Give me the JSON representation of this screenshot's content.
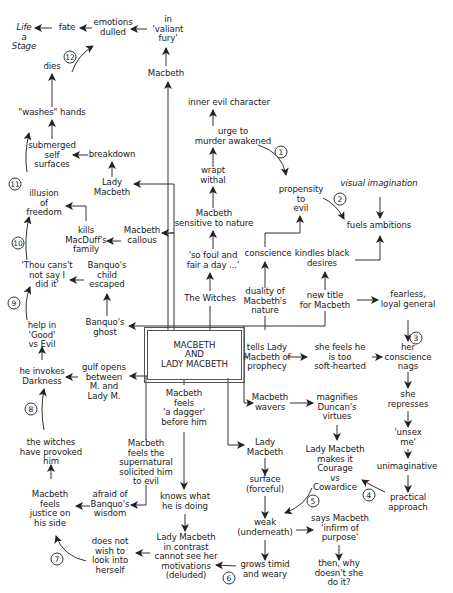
{
  "diagram": {
    "title": "MACBETH\nAND\nLADY MACBETH",
    "nodes": [
      {
        "id": "life-stage",
        "text": "Life\na\nStage",
        "italic": true,
        "x": 24,
        "y": 37
      },
      {
        "id": "fate",
        "text": "fate",
        "x": 67,
        "y": 28
      },
      {
        "id": "emotions-dulled",
        "text": "emotions\ndulled",
        "x": 113,
        "y": 28
      },
      {
        "id": "valiant-fury",
        "text": "in\n'valiant\nfury'",
        "x": 168,
        "y": 29
      },
      {
        "id": "dies",
        "text": "dies",
        "x": 52,
        "y": 67
      },
      {
        "id": "macbeth-top",
        "text": "Macbeth",
        "x": 166,
        "y": 74
      },
      {
        "id": "inner-evil",
        "text": "inner evil character",
        "x": 229,
        "y": 103
      },
      {
        "id": "washes-hands",
        "text": "\"washes\" hands",
        "x": 52,
        "y": 113
      },
      {
        "id": "urge-murder",
        "text": "urge to\nmurder awakened",
        "x": 233,
        "y": 137
      },
      {
        "id": "submerged-self",
        "text": "submerged\nself\nsurfaces",
        "x": 52,
        "y": 155
      },
      {
        "id": "breakdown",
        "text": "breakdown",
        "x": 112,
        "y": 155
      },
      {
        "id": "wrapt-withal",
        "text": "wrapt\nwithal",
        "x": 213,
        "y": 176
      },
      {
        "id": "lady-macbeth-left",
        "text": "Lady\nMacbeth",
        "x": 112,
        "y": 188
      },
      {
        "id": "propensity-evil",
        "text": "propensity\nto\nevil",
        "x": 301,
        "y": 199
      },
      {
        "id": "visual-imagination",
        "text": "visual imagination",
        "italic": true,
        "x": 379,
        "y": 184
      },
      {
        "id": "illusion-freedom",
        "text": "illusion\nof\nfreedom",
        "x": 44,
        "y": 203
      },
      {
        "id": "fuels-ambitions",
        "text": "fuels ambitions",
        "x": 379,
        "y": 226
      },
      {
        "id": "macbeth-sensitive",
        "text": "Macbeth\nsensitive to nature",
        "x": 214,
        "y": 219
      },
      {
        "id": "kills-macduff",
        "text": "kills\nMacDuff's\nfamily",
        "x": 86,
        "y": 240
      },
      {
        "id": "macbeth-callous",
        "text": "Macbeth\ncallous",
        "x": 142,
        "y": 236
      },
      {
        "id": "so-foul",
        "text": "'so foul and\nfair a day ...'",
        "x": 213,
        "y": 261
      },
      {
        "id": "conscience",
        "text": "conscience",
        "x": 268,
        "y": 254
      },
      {
        "id": "kindles-desires",
        "text": "kindles black\ndesires",
        "x": 322,
        "y": 259
      },
      {
        "id": "thou-canst",
        "text": "'Thou cans't\nnot say I\ndid it'",
        "x": 47,
        "y": 275
      },
      {
        "id": "banquo-child",
        "text": "Banquo's\nchild\nescaped",
        "x": 107,
        "y": 275
      },
      {
        "id": "the-witches",
        "text": "The Witches",
        "x": 210,
        "y": 299
      },
      {
        "id": "duality-nature",
        "text": "duality of\nMacbeth's\nnature",
        "x": 265,
        "y": 301
      },
      {
        "id": "new-title",
        "text": "new title\nfor Macbeth",
        "x": 325,
        "y": 301
      },
      {
        "id": "fearless-general",
        "text": "fearless,\nloyal general",
        "x": 408,
        "y": 300
      },
      {
        "id": "help-good-evil",
        "text": "help in\n'Good'\nvs Evil",
        "x": 42,
        "y": 335
      },
      {
        "id": "banquo-ghost",
        "text": "Banquo's\nghost",
        "x": 105,
        "y": 328
      },
      {
        "id": "tells-lady",
        "text": "tells Lady\nMacbeth of\nprophecy",
        "x": 267,
        "y": 357
      },
      {
        "id": "she-feels",
        "text": "she feels he\nis too\nsoft-hearted",
        "x": 340,
        "y": 357
      },
      {
        "id": "her-conscience",
        "text": "her\nconscience\nnags",
        "x": 408,
        "y": 357,
        "italicFirst": true
      },
      {
        "id": "he-invokes",
        "text": "he invokes\nDarkness",
        "x": 42,
        "y": 377
      },
      {
        "id": "gulf-opens",
        "text": "gulf opens\nbetween\nM. and\nLady M.",
        "x": 104,
        "y": 382
      },
      {
        "id": "macbeth-dagger",
        "text": "Macbeth\nfeels\n'a dagger'\nbefore him",
        "x": 184,
        "y": 408
      },
      {
        "id": "macbeth-wavers",
        "text": "Macbeth\nwavers",
        "x": 270,
        "y": 403
      },
      {
        "id": "magnifies-duncan",
        "text": "magnifies\nDuncan's\nvirtues",
        "x": 337,
        "y": 407
      },
      {
        "id": "she-represses",
        "text": "she\nrepresses",
        "x": 408,
        "y": 400
      },
      {
        "id": "unsex-me",
        "text": "'unsex\nme'",
        "x": 408,
        "y": 438
      },
      {
        "id": "witches-provoked",
        "text": "the witches\nhave provoked\nhim",
        "x": 51,
        "y": 452
      },
      {
        "id": "supernatural",
        "text": "Macbeth\nfeels the\nsupernatural\nsolicited him\nto evil",
        "x": 146,
        "y": 463
      },
      {
        "id": "lady-macbeth-center",
        "text": "Lady\nMacbeth",
        "x": 265,
        "y": 448
      },
      {
        "id": "lady-courage",
        "text": "Lady Macbeth\nmakes it\nCourage\nvs\nCowardice",
        "x": 335,
        "y": 469,
        "italicLines": [
          2,
          4
        ]
      },
      {
        "id": "unimaginative",
        "text": "unimaginative",
        "x": 407,
        "y": 467
      },
      {
        "id": "surface-forceful",
        "text": "surface\n(forceful)",
        "x": 265,
        "y": 485
      },
      {
        "id": "practical-approach",
        "text": "practical\napproach",
        "x": 408,
        "y": 503,
        "italicFirst": true
      },
      {
        "id": "macbeth-justice",
        "text": "Macbeth\nfeels\njustice on\nhis side",
        "x": 50,
        "y": 509
      },
      {
        "id": "afraid-banquo",
        "text": "afraid of\nBanquo's\nwisdom",
        "x": 110,
        "y": 504
      },
      {
        "id": "knows-what",
        "text": "knows what\nhe is doing",
        "x": 185,
        "y": 502
      },
      {
        "id": "weak-underneath",
        "text": "weak\n(underneath)",
        "x": 265,
        "y": 528
      },
      {
        "id": "says-infirm",
        "text": "says Macbeth\n'infirm of\npurpose'",
        "x": 340,
        "y": 528
      },
      {
        "id": "does-not-wish",
        "text": "does not\nwish to\nlook into\nherself",
        "x": 110,
        "y": 556
      },
      {
        "id": "lady-contrast",
        "text": "Lady Macbeth\nin contrast\ncannot see her\nmotivations\n(deluded)",
        "x": 186,
        "y": 557
      },
      {
        "id": "grows-timid",
        "text": "grows timid\nand weary",
        "x": 265,
        "y": 570
      },
      {
        "id": "then-why",
        "text": "then, why\ndoesn't she\ndo it?",
        "x": 339,
        "y": 573,
        "italicWord": "she"
      }
    ],
    "step_numbers": [
      {
        "n": "1",
        "x": 281,
        "y": 152
      },
      {
        "n": "2",
        "x": 340,
        "y": 199
      },
      {
        "n": "3",
        "x": 416,
        "y": 338
      },
      {
        "n": "4",
        "x": 369,
        "y": 495
      },
      {
        "n": "5",
        "x": 313,
        "y": 501
      },
      {
        "n": "6",
        "x": 229,
        "y": 578
      },
      {
        "n": "7",
        "x": 57,
        "y": 559
      },
      {
        "n": "8",
        "x": 31,
        "y": 409
      },
      {
        "n": "9",
        "x": 14,
        "y": 303
      },
      {
        "n": "10",
        "x": 18,
        "y": 243
      },
      {
        "n": "11",
        "x": 15,
        "y": 184
      },
      {
        "n": "12",
        "x": 70,
        "y": 57
      }
    ],
    "colors": {
      "line": "#333333",
      "text": "#222222",
      "background": "#ffffff"
    }
  }
}
